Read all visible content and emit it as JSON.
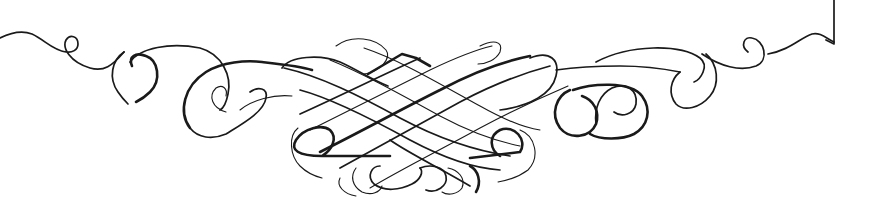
{
  "image": {
    "description": "Calligraphic ornamental flourish / scroll divider",
    "ink_color": "#1a1a1a",
    "background_color": "#ffffff",
    "parts": [
      "left-scroll",
      "center-lattice-knot",
      "bottom-curls",
      "right-scroll",
      "corner-bracket"
    ]
  }
}
